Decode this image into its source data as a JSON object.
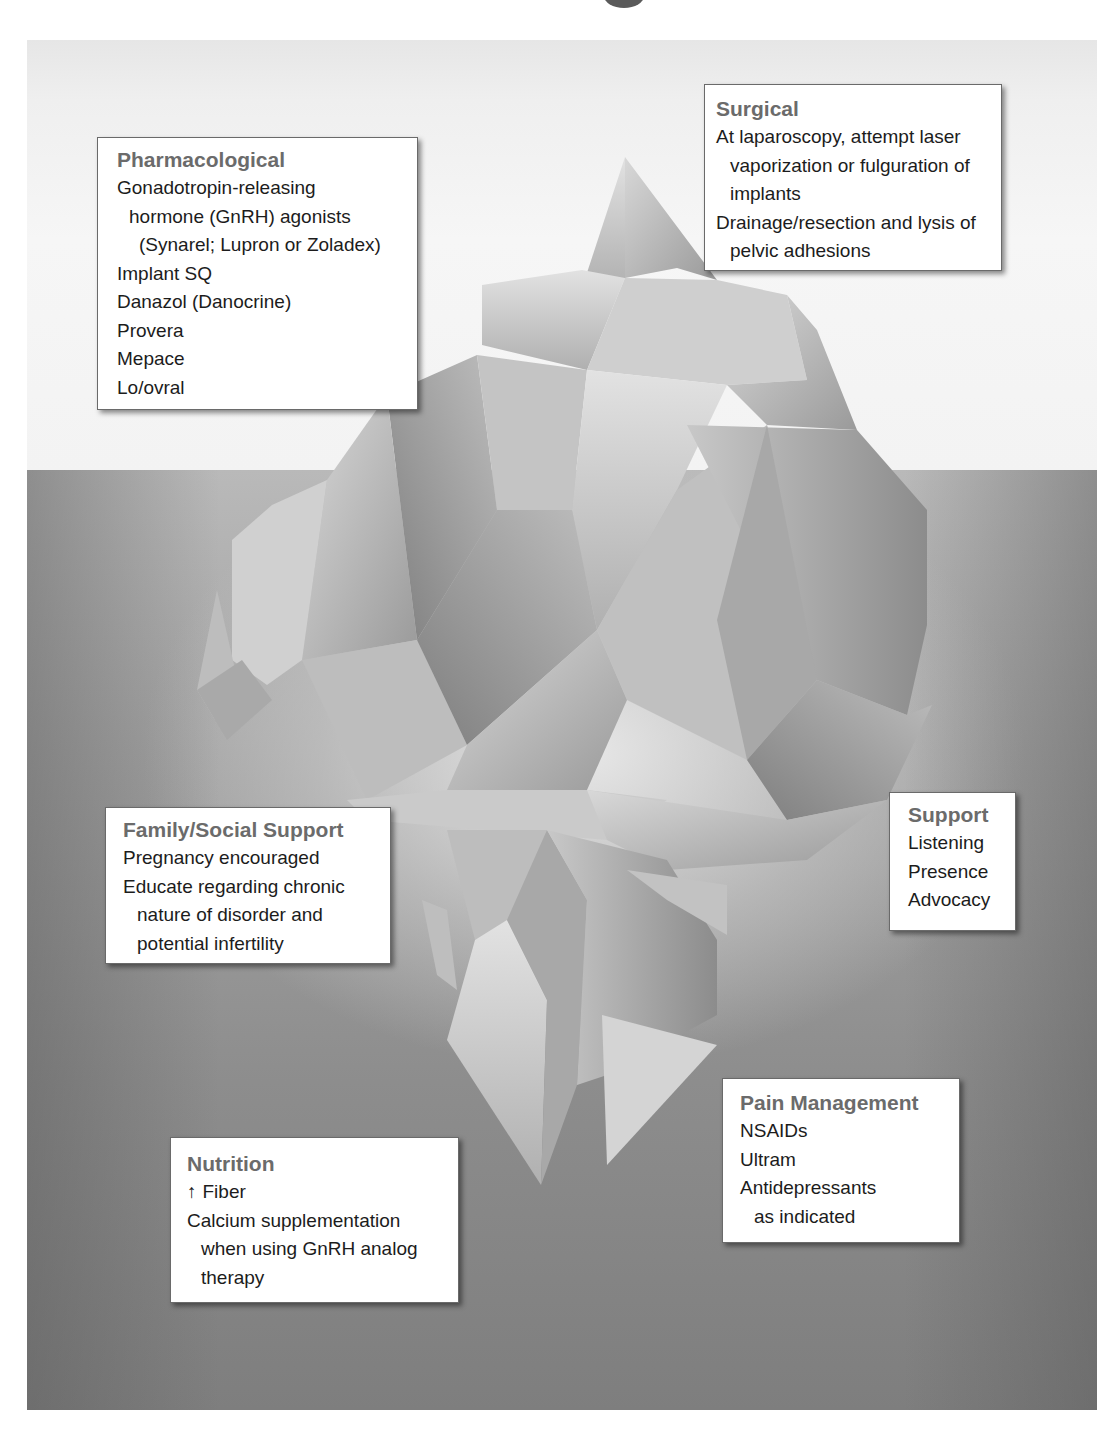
{
  "diagram": {
    "type": "iceberg",
    "colors": {
      "sky": "#f3f3f3",
      "water_top": "#b9b9b9",
      "water_bottom": "#7e7e7e",
      "box_heading": "#6b6b6b",
      "box_text": "#1c1c1c",
      "box_border": "#6a6a6a"
    }
  },
  "boxes": {
    "pharmacological": {
      "heading": "Pharmacological",
      "items": [
        "Gonadotropin-releasing hormone (GnRH) agonists (Synarel; Lupron or Zoladex)",
        "Implant SQ",
        "Danazol (Danocrine)",
        "Provera",
        "Mepace",
        "Lo/ovral"
      ],
      "item0_lines": [
        "Gonadotropin-releasing",
        "hormone (GnRH) agonists",
        "(Synarel; Lupron or Zoladex)"
      ]
    },
    "surgical": {
      "heading": "Surgical",
      "items": [
        "At laparoscopy, attempt laser vaporization or fulguration of implants",
        "Drainage/resection and lysis of pelvic adhesions"
      ],
      "item0_lines": [
        "At laparoscopy, attempt laser",
        "vaporization or fulguration of",
        "implants"
      ],
      "item1_lines": [
        "Drainage/resection and lysis of",
        "pelvic adhesions"
      ]
    },
    "family_social_support": {
      "heading": "Family/Social Support",
      "items": [
        "Pregnancy encouraged",
        "Educate regarding chronic nature of disorder and potential infertility"
      ],
      "item1_lines": [
        "Educate regarding chronic",
        "nature of disorder and",
        "potential infertility"
      ]
    },
    "support": {
      "heading": "Support",
      "items": [
        "Listening",
        "Presence",
        "Advocacy"
      ]
    },
    "pain_management": {
      "heading": "Pain Management",
      "items": [
        "NSAIDs",
        "Ultram",
        "Antidepressants as indicated"
      ],
      "item2_lines": [
        "Antidepressants",
        "as indicated"
      ]
    },
    "nutrition": {
      "heading": "Nutrition",
      "items": [
        "↑ Fiber",
        "Calcium supplementation when using GnRH analog therapy"
      ],
      "item0_arrow": "↑",
      "item0_text": "Fiber",
      "item1_lines": [
        "Calcium supplementation",
        "when using GnRH analog",
        "therapy"
      ]
    }
  }
}
